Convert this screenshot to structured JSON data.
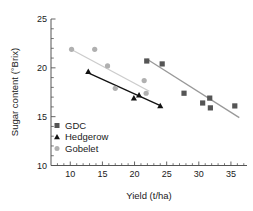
{
  "chart_data": {
    "type": "scatter",
    "title": "",
    "xlabel": "Yield (t/ha)",
    "ylabel": "Sugar content (°Brix)",
    "xlim": [
      7,
      37.5
    ],
    "ylim": [
      10,
      25
    ],
    "xticks": [
      10,
      15,
      20,
      25,
      30,
      35
    ],
    "yticks": [
      25,
      20,
      15,
      10
    ],
    "xtick_labels": [
      "10",
      "15",
      "20",
      "25",
      "30",
      "35"
    ],
    "ytick_labels": [
      "25",
      "20",
      "15",
      "10"
    ],
    "grid": false,
    "legend_position": "lower-left",
    "series": [
      {
        "name": "GDC",
        "marker": "square",
        "color": "#555555",
        "trend_color": "#999999",
        "points": [
          {
            "x": 21.9,
            "y": 20.7
          },
          {
            "x": 24.3,
            "y": 20.4
          },
          {
            "x": 27.7,
            "y": 17.4
          },
          {
            "x": 30.6,
            "y": 16.4
          },
          {
            "x": 31.7,
            "y": 16.9
          },
          {
            "x": 31.8,
            "y": 15.9
          },
          {
            "x": 35.6,
            "y": 16.1
          }
        ],
        "trendline": {
          "x1": 21.9,
          "y1": 20.9,
          "x2": 36.3,
          "y2": 14.9
        }
      },
      {
        "name": "Hedgerow",
        "marker": "triangle",
        "color": "#111111",
        "trend_color": "#111111",
        "points": [
          {
            "x": 12.8,
            "y": 19.6
          },
          {
            "x": 19.9,
            "y": 16.9
          },
          {
            "x": 20.7,
            "y": 17.2
          },
          {
            "x": 24.0,
            "y": 16.1
          }
        ],
        "trendline": {
          "x1": 12.7,
          "y1": 19.5,
          "x2": 24.1,
          "y2": 16.1
        }
      },
      {
        "name": "Gobelet",
        "marker": "circle",
        "color": "#b0b0b0",
        "trend_color": "#cccccc",
        "points": [
          {
            "x": 10.2,
            "y": 21.9
          },
          {
            "x": 13.8,
            "y": 21.9
          },
          {
            "x": 15.8,
            "y": 20.2
          },
          {
            "x": 17.0,
            "y": 17.9
          },
          {
            "x": 21.5,
            "y": 18.7
          },
          {
            "x": 21.8,
            "y": 17.4
          }
        ],
        "trendline": {
          "x1": 10.1,
          "y1": 21.9,
          "x2": 22.3,
          "y2": 17.6
        }
      }
    ]
  },
  "legend": {
    "items": [
      {
        "label": "GDC",
        "marker": "square",
        "color": "#555555"
      },
      {
        "label": "Hedgerow",
        "marker": "triangle",
        "color": "#111111"
      },
      {
        "label": "Gobelet",
        "marker": "circle",
        "color": "#b0b0b0"
      }
    ]
  }
}
